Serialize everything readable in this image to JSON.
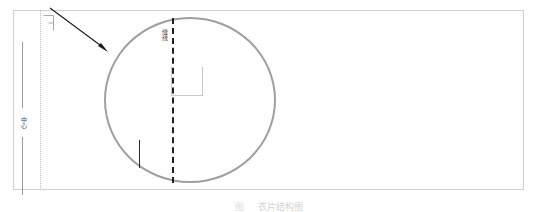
{
  "document": {
    "type": "technical-drawing",
    "background_color": "#ffffff"
  },
  "sheet": {
    "outline_color": "#cfcfcf"
  },
  "dimensions": {
    "left_vertical_label": "中心",
    "line_color": "#9a9a9a"
  },
  "fold_line": {
    "style": "dotted",
    "color": "#bcbcbc"
  },
  "detail_view": {
    "circle_color": "#9f9f9f",
    "annotation_label": "缝线",
    "seam_line_style": "dashed",
    "seam_line_color": "#1f1f1f",
    "bracket_color": "#cbcbcb",
    "stitch_color": "#2a2a2a"
  },
  "leader": {
    "arrow_color": "#1a1a1a"
  },
  "caption": {
    "figure_number": "图",
    "figure_text": "衣片结构图"
  }
}
